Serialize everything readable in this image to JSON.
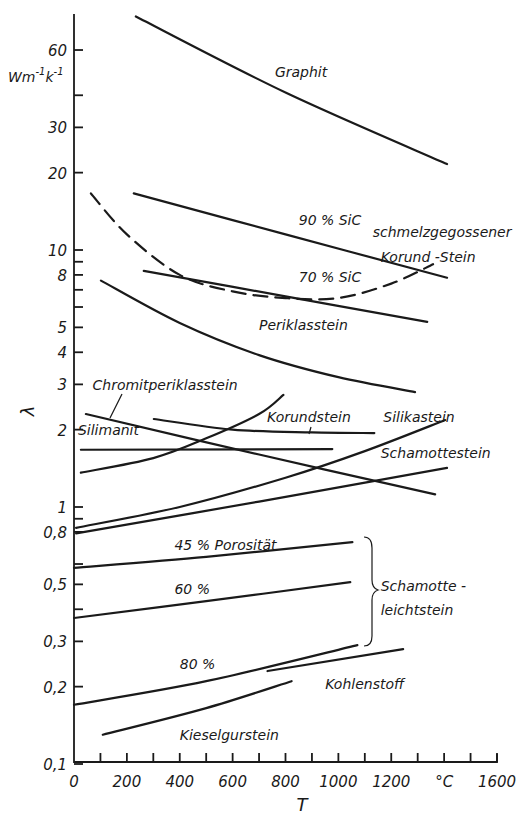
{
  "chart_data": {
    "type": "line",
    "title": "",
    "xlabel": "T",
    "x_unit": "°C",
    "ylabel": "λ",
    "y_unit": "W m⁻¹ K⁻¹",
    "xlim": [
      0,
      1600
    ],
    "ylim": [
      0.1,
      90
    ],
    "yscale": "log",
    "grid": false,
    "legend": "inline labels",
    "x_ticks": [
      {
        "value": 0,
        "label": "0"
      },
      {
        "value": 100,
        "label": ""
      },
      {
        "value": 200,
        "label": "200"
      },
      {
        "value": 300,
        "label": ""
      },
      {
        "value": 400,
        "label": "400"
      },
      {
        "value": 500,
        "label": ""
      },
      {
        "value": 600,
        "label": "600"
      },
      {
        "value": 700,
        "label": ""
      },
      {
        "value": 800,
        "label": "800"
      },
      {
        "value": 900,
        "label": ""
      },
      {
        "value": 1000,
        "label": "1000"
      },
      {
        "value": 1100,
        "label": ""
      },
      {
        "value": 1200,
        "label": "1200"
      },
      {
        "value": 1300,
        "label": ""
      },
      {
        "value": 1400,
        "label": "°C"
      },
      {
        "value": 1500,
        "label": ""
      },
      {
        "value": 1600,
        "label": "1600"
      }
    ],
    "y_ticks": [
      {
        "value": 60,
        "label": "60"
      },
      {
        "value": 40,
        "label": ""
      },
      {
        "value": 30,
        "label": "30"
      },
      {
        "value": 20,
        "label": "20"
      },
      {
        "value": 10,
        "label": "10"
      },
      {
        "value": 9,
        "label": ""
      },
      {
        "value": 8,
        "label": "8"
      },
      {
        "value": 7,
        "label": ""
      },
      {
        "value": 6,
        "label": ""
      },
      {
        "value": 5,
        "label": "5"
      },
      {
        "value": 4,
        "label": "4"
      },
      {
        "value": 3,
        "label": "3"
      },
      {
        "value": 2,
        "label": "2"
      },
      {
        "value": 1,
        "label": "1"
      },
      {
        "value": 0.9,
        "label": ""
      },
      {
        "value": 0.8,
        "label": "0,8"
      },
      {
        "value": 0.6,
        "label": ""
      },
      {
        "value": 0.5,
        "label": "0,5"
      },
      {
        "value": 0.4,
        "label": ""
      },
      {
        "value": 0.3,
        "label": "0,3"
      },
      {
        "value": 0.2,
        "label": "0,2"
      },
      {
        "value": 0.1,
        "label": "0,1"
      }
    ],
    "series": [
      {
        "name": "Graphit",
        "style": "solid",
        "points": [
          [
            234,
            81
          ],
          [
            800,
            41
          ],
          [
            1411,
            21.6
          ]
        ]
      },
      {
        "name": "90 % SiC",
        "style": "solid",
        "points": [
          [
            226,
            16.6
          ],
          [
            800,
            11.5
          ],
          [
            1411,
            7.8
          ]
        ]
      },
      {
        "name": "70 % SiC",
        "style": "solid",
        "points": [
          [
            264,
            8.3
          ],
          [
            800,
            6.6
          ],
          [
            1336,
            5.25
          ]
        ]
      },
      {
        "name": "schmelzgegossener Korund-Stein",
        "style": "dashed",
        "points": [
          [
            64,
            16.6
          ],
          [
            200,
            11.5
          ],
          [
            400,
            8.0
          ],
          [
            600,
            6.9
          ],
          [
            800,
            6.5
          ],
          [
            1000,
            6.5
          ],
          [
            1200,
            7.4
          ],
          [
            1358,
            8.8
          ]
        ]
      },
      {
        "name": "Periklasstein",
        "style": "solid",
        "points": [
          [
            102,
            7.6
          ],
          [
            400,
            5.2
          ],
          [
            700,
            3.9
          ],
          [
            1000,
            3.2
          ],
          [
            1290,
            2.8
          ]
        ]
      },
      {
        "name": "Chromitperiklasstein",
        "style": "solid",
        "points": [
          [
            45,
            2.3
          ],
          [
            700,
            1.6
          ],
          [
            1366,
            1.12
          ]
        ]
      },
      {
        "name": "Korundstein",
        "style": "solid",
        "points": [
          [
            302,
            2.2
          ],
          [
            600,
            2.0
          ],
          [
            900,
            1.95
          ],
          [
            1136,
            1.94
          ]
        ]
      },
      {
        "name": "Silimanit",
        "style": "solid",
        "points": [
          [
            26,
            1.67
          ],
          [
            977,
            1.68
          ]
        ]
      },
      {
        "name": "Silikastein (steigend, steil)",
        "style": "solid",
        "points": [
          [
            26,
            1.36
          ],
          [
            300,
            1.55
          ],
          [
            500,
            1.85
          ],
          [
            700,
            2.3
          ],
          [
            792,
            2.73
          ]
        ]
      },
      {
        "name": "Silikastein",
        "style": "solid",
        "points": [
          [
            8,
            0.83
          ],
          [
            400,
            1.0
          ],
          [
            800,
            1.3
          ],
          [
            1100,
            1.65
          ],
          [
            1404,
            2.18
          ]
        ]
      },
      {
        "name": "Schamottestein",
        "style": "solid",
        "points": [
          [
            8,
            0.79
          ],
          [
            700,
            1.05
          ],
          [
            1411,
            1.42
          ]
        ]
      },
      {
        "name": "Schamotteleichtstein 45 % Porosität",
        "style": "solid",
        "points": [
          [
            0,
            0.58
          ],
          [
            500,
            0.64
          ],
          [
            1053,
            0.73
          ]
        ]
      },
      {
        "name": "Schamotteleichtstein 60 %",
        "style": "solid",
        "points": [
          [
            0,
            0.37
          ],
          [
            500,
            0.43
          ],
          [
            1045,
            0.51
          ]
        ]
      },
      {
        "name": "Schamotteleichtstein 80 %",
        "style": "solid",
        "points": [
          [
            0,
            0.17
          ],
          [
            500,
            0.21
          ],
          [
            1072,
            0.29
          ]
        ]
      },
      {
        "name": "Kohlenstoff",
        "style": "solid",
        "points": [
          [
            732,
            0.23
          ],
          [
            1245,
            0.28
          ]
        ]
      },
      {
        "name": "Kieselgurstein",
        "style": "solid",
        "points": [
          [
            109,
            0.13
          ],
          [
            500,
            0.165
          ],
          [
            823,
            0.21
          ]
        ]
      }
    ],
    "annotations": [
      {
        "text": "Graphit",
        "x": 760,
        "y": 47
      },
      {
        "text": "90 % SiC",
        "x": 850,
        "y": 12.5
      },
      {
        "text": "schmelzgegossener",
        "x": 1130,
        "y": 11.2
      },
      {
        "text": "Korund -Stein",
        "x": 1160,
        "y": 9.0
      },
      {
        "text": "70 % SiC",
        "x": 850,
        "y": 7.5
      },
      {
        "text": "Periklasstein",
        "x": 700,
        "y": 4.9
      },
      {
        "text": "Chromitperiklasstein",
        "x": 70,
        "y": 2.85
      },
      {
        "text": "Korundstein",
        "x": 730,
        "y": 2.15
      },
      {
        "text": "Silikastein",
        "x": 1170,
        "y": 2.15
      },
      {
        "text": "Silimanit",
        "x": 15,
        "y": 1.9
      },
      {
        "text": "Schamottestein",
        "x": 1160,
        "y": 1.55
      },
      {
        "text": "45 % Porosität",
        "x": 380,
        "y": 0.68
      },
      {
        "text": "60 %",
        "x": 380,
        "y": 0.46
      },
      {
        "text": "Schamotte -",
        "x": 1160,
        "y": 0.47
      },
      {
        "text": "leichtstein",
        "x": 1160,
        "y": 0.38
      },
      {
        "text": "80 %",
        "x": 400,
        "y": 0.235
      },
      {
        "text": "Kohlenstoff",
        "x": 950,
        "y": 0.195
      },
      {
        "text": "Kieselgurstein",
        "x": 400,
        "y": 0.124
      }
    ]
  },
  "labels": {
    "y_axis_symbol": "λ",
    "y_unit_main": "Wm",
    "y_unit_exp1": "-1",
    "y_unit_k": "k",
    "y_unit_exp2": "-1",
    "x_axis_symbol": "T"
  }
}
